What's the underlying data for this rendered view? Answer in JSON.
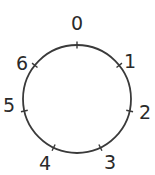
{
  "diagram": {
    "type": "circular-number-line",
    "circle": {
      "cx": 77,
      "cy": 99,
      "r": 54,
      "stroke": "#3a3a3a",
      "stroke_width": 1.8
    },
    "tick_length": 7,
    "points": [
      {
        "label": "0",
        "angle_deg": 0,
        "label_x": 77,
        "label_y": 30
      },
      {
        "label": "1",
        "angle_deg": 51.43,
        "label_x": 130,
        "label_y": 68
      },
      {
        "label": "2",
        "angle_deg": 102.86,
        "label_x": 145,
        "label_y": 119
      },
      {
        "label": "3",
        "angle_deg": 154.29,
        "label_x": 110,
        "label_y": 169
      },
      {
        "label": "4",
        "angle_deg": 205.71,
        "label_x": 45,
        "label_y": 170
      },
      {
        "label": "5",
        "angle_deg": 257.14,
        "label_x": 9,
        "label_y": 112
      },
      {
        "label": "6",
        "angle_deg": 308.57,
        "label_x": 22,
        "label_y": 70
      }
    ]
  }
}
